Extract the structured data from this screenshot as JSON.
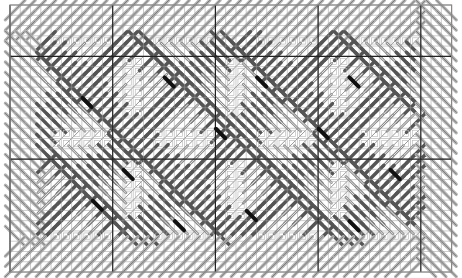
{
  "diagram": {
    "grid": {
      "x0": 10,
      "y0": 5,
      "cols": 43,
      "rows": 26,
      "cell": 10.27,
      "major_every": 10,
      "major_x_cols": [
        0,
        10,
        20,
        30,
        40
      ],
      "major_y_rows": [
        5,
        15
      ],
      "minor_color": "#9a9a9a",
      "major_color": "#222222",
      "border_color": "#888888"
    },
    "colors": {
      "light_stitch": "#b5b5b5",
      "mid_stitch": "#8a8a8a",
      "dark_stitch": "#555555",
      "accent_stitch": "#111111",
      "outline_stitch": "#6a6a6a",
      "paper": "#ffffff"
    },
    "regions": {
      "border_band_rows": 3,
      "border_band_cols": 3,
      "motif_count_x": 4,
      "motif_count_y": 2,
      "motif_size": 10
    },
    "accent_marks": [
      [
        7,
        9
      ],
      [
        15,
        7
      ],
      [
        24,
        7
      ],
      [
        33,
        7
      ],
      [
        11,
        16
      ],
      [
        20,
        12
      ],
      [
        30,
        12
      ],
      [
        37,
        16
      ],
      [
        8,
        19
      ],
      [
        23,
        20
      ],
      [
        33,
        21
      ],
      [
        16,
        21
      ]
    ]
  }
}
